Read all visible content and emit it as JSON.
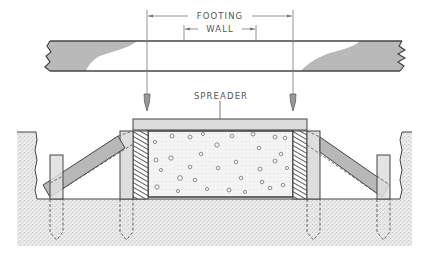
{
  "diagram": {
    "type": "technical-drawing",
    "labels": {
      "footing": "FOOTING",
      "wall": "WALL",
      "spreader": "SPREADER"
    },
    "dimensions": [
      {
        "label": "FOOTING",
        "from_x": 147,
        "to_x": 293,
        "y": 16
      },
      {
        "label": "WALL",
        "from_x": 184,
        "to_x": 256,
        "y": 29
      }
    ],
    "components": [
      "batter board (top plank)",
      "plumb bob left",
      "plumb bob right",
      "spreader",
      "form board left",
      "form board right",
      "concrete footing",
      "stake left outer",
      "stake left inner",
      "stake right inner",
      "stake right outer",
      "brace left",
      "brace right",
      "ground / excavation"
    ],
    "colors": {
      "line": "#444444",
      "wood_fill": "#d9d9d9",
      "wood_grain": "#a8a8a8",
      "ground_fill": "#e6e6e6",
      "brace_fill": "#b5b5b5",
      "concrete_fill": "#f2f2f2",
      "label": "#555555"
    }
  }
}
